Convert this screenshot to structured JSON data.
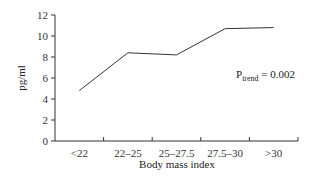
{
  "chart_data": {
    "type": "line",
    "title": "",
    "xlabel": "Body mass index",
    "ylabel": "pg/ml",
    "categories": [
      "<22",
      "22–25",
      "25–27.5",
      "27.5–30",
      ">30"
    ],
    "values": [
      4.8,
      8.4,
      8.2,
      10.7,
      10.8
    ],
    "ylim": [
      0,
      12
    ],
    "yticks": [
      0,
      2,
      4,
      6,
      8,
      10,
      12
    ],
    "grid": false,
    "legend": null,
    "annotation": {
      "main": "P",
      "subscript": "trend",
      "rest": " = 0.002"
    }
  }
}
